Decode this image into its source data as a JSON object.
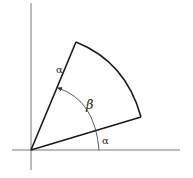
{
  "diagram": {
    "title": "",
    "labels": {
      "side_label": "α",
      "angle_beta": "β",
      "angle_alpha": "α"
    },
    "colors": {
      "stroke": "#1a1a1a",
      "axis": "#555555",
      "background": "#ffffff"
    }
  }
}
